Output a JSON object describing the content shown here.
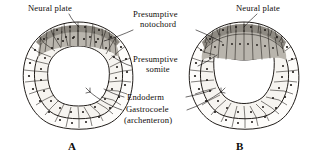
{
  "figure": {
    "title_visible": false,
    "background_color": "#ffffff",
    "ink_color": "#16120f"
  },
  "labels": {
    "neural_plate_left": "Neural plate",
    "neural_plate_right": "Neural plate",
    "presumptive_notochord_line1": "Presumptive",
    "presumptive_notochord_line2": "notochord",
    "presumptive_somite_line1": "Presumptive",
    "presumptive_somite_line2": "somite",
    "endoderm": "Endoderm",
    "gastrocoele": "Gastrocoele",
    "archenteron": "(archenteron)"
  },
  "panels": [
    {
      "id": "A",
      "caption": "A",
      "stage": "early neurula"
    },
    {
      "id": "B",
      "caption": "B",
      "stage": "later neurula"
    }
  ],
  "tissue_colors": {
    "neural_plate": "#8e8a82",
    "presumptive_notochord": "#b9b5ad",
    "ectoderm": "#fdfcfa",
    "endoderm": "#f6f4f0",
    "gastrocoele": "#ffffff"
  }
}
